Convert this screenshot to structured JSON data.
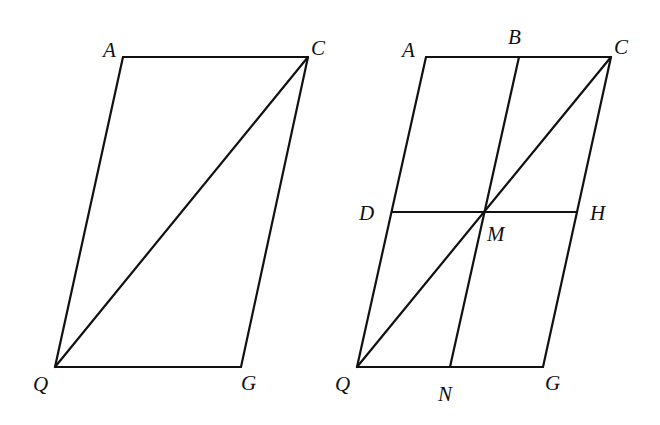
{
  "figures": [
    {
      "id": "left",
      "points": {
        "A": {
          "x": 123,
          "y": 57
        },
        "C": {
          "x": 308,
          "y": 57
        },
        "Q": {
          "x": 55,
          "y": 367
        },
        "G": {
          "x": 241,
          "y": 367
        }
      },
      "segments": [
        [
          "A",
          "C"
        ],
        [
          "A",
          "Q"
        ],
        [
          "C",
          "G"
        ],
        [
          "Q",
          "G"
        ],
        [
          "Q",
          "C"
        ]
      ],
      "labels": [
        {
          "text": "A",
          "x": 103,
          "y": 40
        },
        {
          "text": "C",
          "x": 311,
          "y": 38
        },
        {
          "text": "Q",
          "x": 33,
          "y": 374
        },
        {
          "text": "G",
          "x": 241,
          "y": 373
        }
      ]
    },
    {
      "id": "right",
      "points": {
        "A": {
          "x": 426,
          "y": 57
        },
        "B": {
          "x": 519,
          "y": 57
        },
        "C": {
          "x": 611,
          "y": 57
        },
        "D": {
          "x": 392,
          "y": 212
        },
        "M": {
          "x": 484,
          "y": 212
        },
        "H": {
          "x": 577,
          "y": 212
        },
        "Q": {
          "x": 357,
          "y": 367
        },
        "N": {
          "x": 450,
          "y": 367
        },
        "G": {
          "x": 543,
          "y": 367
        }
      },
      "segments": [
        [
          "A",
          "C"
        ],
        [
          "A",
          "Q"
        ],
        [
          "C",
          "G"
        ],
        [
          "Q",
          "G"
        ],
        [
          "Q",
          "C"
        ],
        [
          "B",
          "N"
        ],
        [
          "D",
          "H"
        ]
      ],
      "labels": [
        {
          "text": "A",
          "x": 402,
          "y": 40
        },
        {
          "text": "B",
          "x": 508,
          "y": 27
        },
        {
          "text": "C",
          "x": 614,
          "y": 37
        },
        {
          "text": "D",
          "x": 359,
          "y": 203
        },
        {
          "text": "M",
          "x": 487,
          "y": 224
        },
        {
          "text": "H",
          "x": 590,
          "y": 203
        },
        {
          "text": "Q",
          "x": 335,
          "y": 374
        },
        {
          "text": "N",
          "x": 438,
          "y": 384
        },
        {
          "text": "G",
          "x": 545,
          "y": 373
        }
      ]
    }
  ],
  "left_labels": {
    "A": "A",
    "C": "C",
    "Q": "Q",
    "G": "G"
  },
  "right_labels": {
    "A": "A",
    "B": "B",
    "C": "C",
    "D": "D",
    "M": "M",
    "H": "H",
    "Q": "Q",
    "N": "N",
    "G": "G"
  }
}
